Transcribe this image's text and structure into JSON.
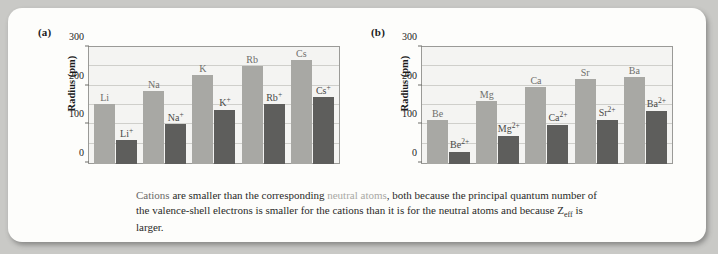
{
  "figure": {
    "caption_lead": "Cations",
    "caption_mid": " are smaller than the corresponding ",
    "caption_highlight": "neutral atoms",
    "caption_rest": ", both because the principal quantum number of the valence-shell electrons is smaller for the cations than it is for the neutral atoms and because Z",
    "caption_sub": "eff",
    "caption_end": " is larger."
  },
  "colors": {
    "atom_bar": "#a8a8a4",
    "ion_bar": "#5e5e5c",
    "plot_background": "#f4f4f2",
    "panel_background": "#fdfdfb"
  },
  "chart_data": [
    {
      "type": "bar",
      "panel": "(a)",
      "title": "",
      "xlabel": "",
      "ylabel": "Radius (pm)",
      "ylim": [
        0,
        300
      ],
      "yticks": [
        0,
        100,
        200,
        300
      ],
      "gridlines": [
        50,
        100,
        150,
        200,
        250
      ],
      "grid": true,
      "legend": "none",
      "categories": [
        "Li",
        "Na",
        "K",
        "Rb",
        "Cs"
      ],
      "series": [
        {
          "name": "neutral atoms",
          "labels": [
            "Li",
            "Na",
            "K",
            "Rb",
            "Cs"
          ],
          "values": [
            152,
            186,
            227,
            248,
            265
          ]
        },
        {
          "name": "cations",
          "labels": [
            "Li+",
            "Na+",
            "K+",
            "Rb+",
            "Cs+"
          ],
          "values": [
            60,
            102,
            138,
            152,
            170
          ]
        }
      ]
    },
    {
      "type": "bar",
      "panel": "(b)",
      "title": "",
      "xlabel": "",
      "ylabel": "Radius (pm)",
      "ylim": [
        0,
        300
      ],
      "yticks": [
        0,
        100,
        200,
        300
      ],
      "gridlines": [
        50,
        100,
        150,
        200,
        250
      ],
      "grid": true,
      "legend": "none",
      "categories": [
        "Be",
        "Mg",
        "Ca",
        "Sr",
        "Ba"
      ],
      "series": [
        {
          "name": "neutral atoms",
          "labels": [
            "Be",
            "Mg",
            "Ca",
            "Sr",
            "Ba"
          ],
          "values": [
            112,
            160,
            197,
            215,
            222
          ]
        },
        {
          "name": "cations",
          "labels": [
            "Be2+",
            "Mg2+",
            "Ca2+",
            "Sr2+",
            "Ba2+"
          ],
          "values": [
            31,
            72,
            100,
            113,
            136
          ]
        }
      ]
    }
  ]
}
